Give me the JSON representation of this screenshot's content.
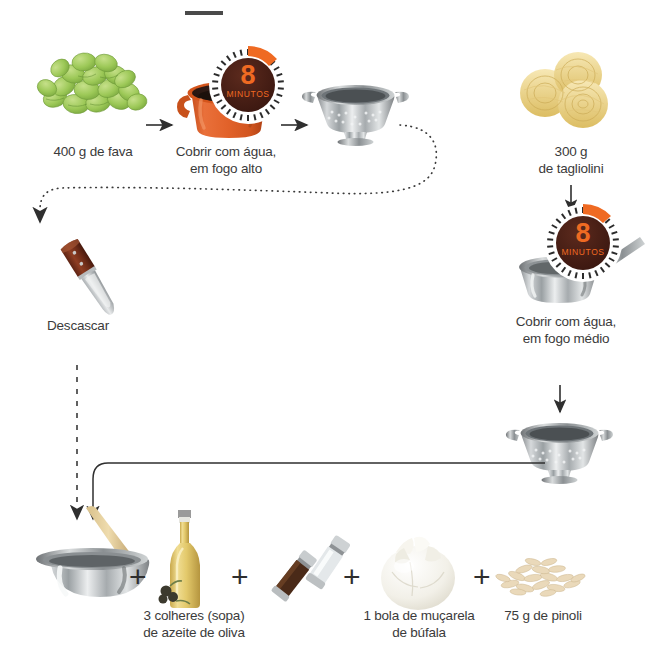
{
  "page": {
    "title_rule": "horizontal-rule",
    "background": "#ffffff",
    "text_color": "#3b3b3b"
  },
  "colors": {
    "timer_orange": "#e8561f",
    "timer_dial": "#4a2118",
    "pot_orange": "#e2622a",
    "fava_green": "#9bc95a",
    "steel": "#b9bcbe",
    "pasta_yellow": "#f0d98e",
    "oil_yellow": "#e8cf7a",
    "knife_handle": "#7a2f1c",
    "line_dark": "#3a3a3a"
  },
  "steps": {
    "fava": {
      "label": "400 g de fava",
      "icon": "fava-beans"
    },
    "pot": {
      "label": "Cobrir com água,\nem fogo alto",
      "icon": "orange-pot",
      "timer": {
        "number": "8",
        "unit": "MINUTOS"
      }
    },
    "colander_fava": {
      "label": "",
      "icon": "colander"
    },
    "tagliolini": {
      "label": "300 g\nde tagliolini",
      "icon": "pasta-nests"
    },
    "saucepan": {
      "label": "Cobrir com água,\nem fogo médio",
      "icon": "saucepan",
      "timer": {
        "number": "8",
        "unit": "MINUTOS"
      }
    },
    "colander_pasta": {
      "label": "",
      "icon": "colander"
    },
    "knife": {
      "label": "Descascar",
      "icon": "paring-knife"
    },
    "bowl": {
      "label": "",
      "icon": "mixing-bowl-with-spoon"
    },
    "olive_oil": {
      "label": "3 colheres (sopa)\nde azeite de oliva",
      "icon": "olive-oil-bottle"
    },
    "grinders": {
      "label": "",
      "icon": "salt-pepper-grinders"
    },
    "mozzarella": {
      "label": "1 bola de muçarela\nde búfala",
      "icon": "mozzarella-ball"
    },
    "pinoli": {
      "label": "75 g de pinoli",
      "icon": "pine-nuts"
    }
  },
  "operators": {
    "plus_1": "+",
    "plus_2": "+",
    "plus_3": "+",
    "plus_4": "+"
  },
  "connectors": {
    "arrow_fava_to_pot": "solid-arrow-right",
    "arrow_pot_to_colander": "solid-arrow-right",
    "dotted_colander_to_knife": "dotted-curve-arrow",
    "arrow_tagliolini_to_saucepan": "solid-arrow-down",
    "arrow_saucepan_to_colander": "solid-arrow-down",
    "dashed_knife_to_bowl": "dashed-arrow-down",
    "solid_colander_to_bowl": "solid-elbow-line"
  }
}
